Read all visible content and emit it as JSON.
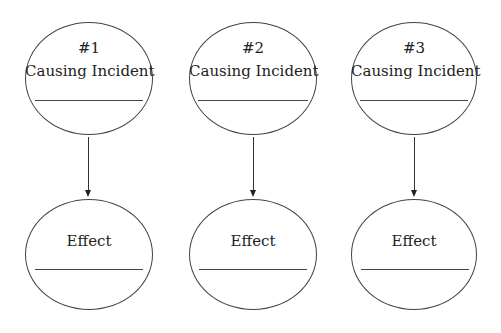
{
  "diagram": {
    "type": "cause-effect",
    "pairs": [
      {
        "number": "#1",
        "cause_label": "Causing Incident",
        "effect_label": "Effect"
      },
      {
        "number": "#2",
        "cause_label": "Causing Incident",
        "effect_label": "Effect"
      },
      {
        "number": "#3",
        "cause_label": "Causing Incident",
        "effect_label": "Effect"
      }
    ],
    "stroke_color": "#444444",
    "background": "#ffffff"
  }
}
